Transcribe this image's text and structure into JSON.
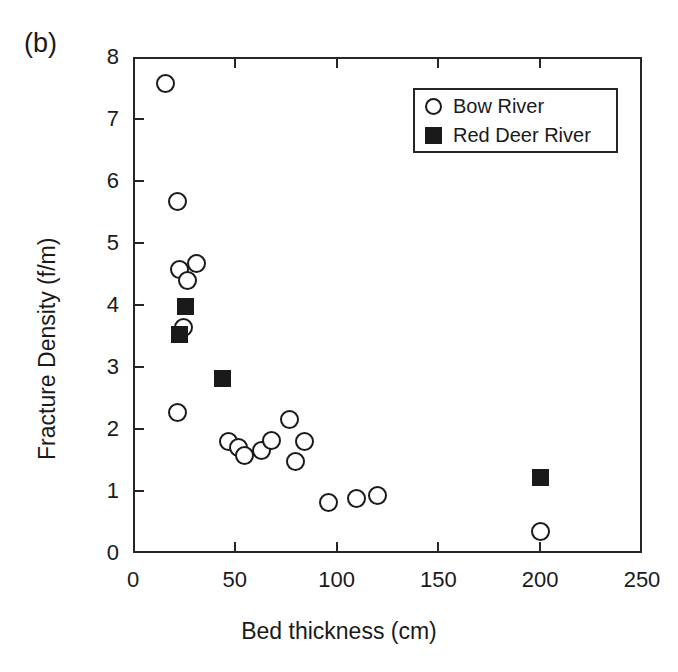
{
  "figure": {
    "panel_label": "(b)",
    "background_color": "#ffffff",
    "foreground_color": "#1a1a1a"
  },
  "chart_data": {
    "type": "scatter",
    "title": "",
    "panel_label": "(b)",
    "xlabel": "Bed thickness (cm)",
    "ylabel": "Fracture Density (f/m)",
    "xlim": [
      0,
      250
    ],
    "ylim": [
      0,
      8
    ],
    "xticks": [
      0,
      50,
      100,
      150,
      200,
      250
    ],
    "yticks": [
      0,
      1,
      2,
      3,
      4,
      5,
      6,
      7,
      8
    ],
    "xtick_labels": [
      "0",
      "50",
      "100",
      "150",
      "200",
      "250"
    ],
    "ytick_labels": [
      "0",
      "1",
      "2",
      "3",
      "4",
      "5",
      "6",
      "7",
      "8"
    ],
    "grid": false,
    "legend_position": "upper right",
    "series": [
      {
        "name": "Bow River",
        "marker": "open-circle",
        "color": "#1a1a1a",
        "fill": "#ffffff",
        "points": [
          {
            "x": 16,
            "y": 7.57
          },
          {
            "x": 22,
            "y": 5.67
          },
          {
            "x": 23,
            "y": 4.58
          },
          {
            "x": 27,
            "y": 4.4
          },
          {
            "x": 31,
            "y": 4.67
          },
          {
            "x": 25,
            "y": 3.63
          },
          {
            "x": 22,
            "y": 2.27
          },
          {
            "x": 47,
            "y": 1.8
          },
          {
            "x": 52,
            "y": 1.7
          },
          {
            "x": 55,
            "y": 1.57
          },
          {
            "x": 63,
            "y": 1.65
          },
          {
            "x": 68,
            "y": 1.82
          },
          {
            "x": 77,
            "y": 2.15
          },
          {
            "x": 80,
            "y": 1.48
          },
          {
            "x": 84,
            "y": 1.8
          },
          {
            "x": 96,
            "y": 0.82
          },
          {
            "x": 110,
            "y": 0.88
          },
          {
            "x": 120,
            "y": 0.93
          },
          {
            "x": 200,
            "y": 0.35
          }
        ]
      },
      {
        "name": "Red Deer River",
        "marker": "filled-square",
        "color": "#1a1a1a",
        "fill": "#1a1a1a",
        "points": [
          {
            "x": 26,
            "y": 3.98
          },
          {
            "x": 23,
            "y": 3.52
          },
          {
            "x": 44,
            "y": 2.81
          },
          {
            "x": 200,
            "y": 1.21
          }
        ]
      }
    ]
  },
  "legend": {
    "entries": [
      {
        "label": "Bow River",
        "marker": "open-circle"
      },
      {
        "label": "Red Deer River",
        "marker": "filled-square"
      }
    ]
  }
}
